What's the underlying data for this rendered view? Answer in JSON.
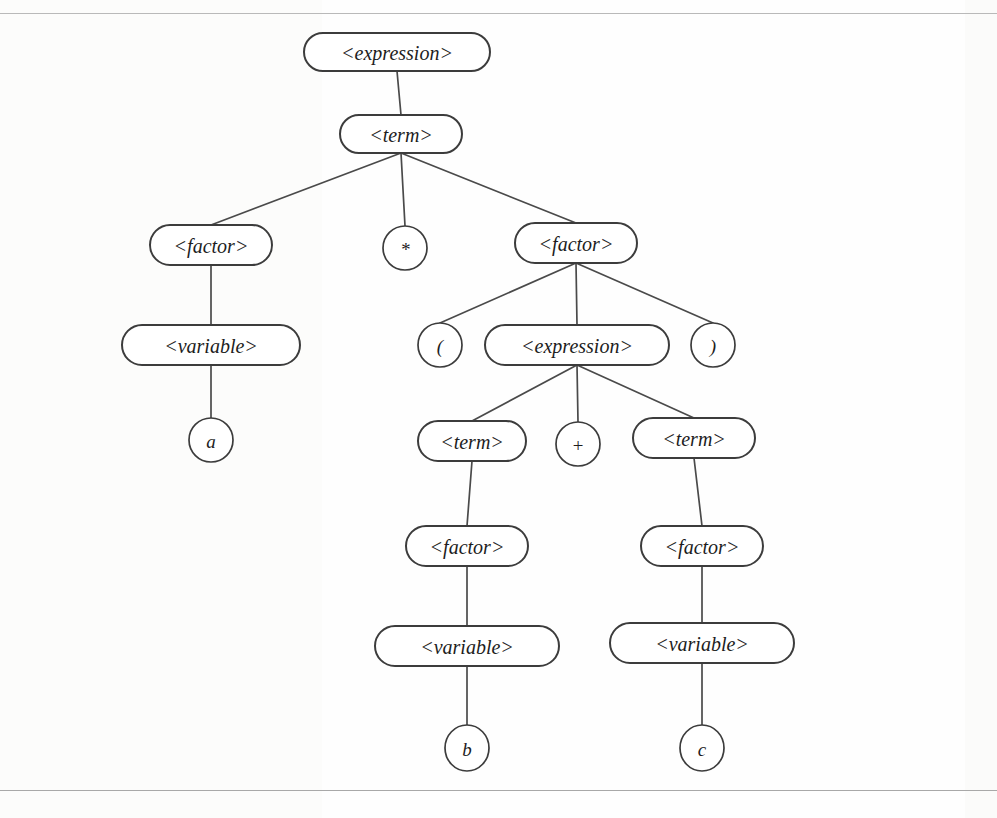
{
  "page": {
    "background_color": "#fefefe",
    "ink_color": "#3c3c3c",
    "rules": {
      "top_y": 13,
      "bottom_y": 790
    }
  },
  "diagram": {
    "type": "parse-tree",
    "grammar_symbols": {
      "nonterminals": [
        "<expression>",
        "<term>",
        "<factor>",
        "<variable>"
      ],
      "terminals": [
        "*",
        "(",
        ")",
        "+",
        "a",
        "b",
        "c"
      ]
    },
    "nodes": [
      {
        "id": "n1",
        "label": "<expression>",
        "kind": "nonterminal",
        "cx": 397,
        "cy": 52,
        "rw": 93,
        "rh": 19
      },
      {
        "id": "n2",
        "label": "<term>",
        "kind": "nonterminal",
        "cx": 401,
        "cy": 134,
        "rw": 61,
        "rh": 19
      },
      {
        "id": "n3",
        "label": "<factor>",
        "kind": "nonterminal",
        "cx": 211,
        "cy": 245,
        "rw": 61,
        "rh": 20
      },
      {
        "id": "n4",
        "label": "*",
        "kind": "terminal",
        "cx": 405,
        "cy": 248,
        "rw": 22,
        "rh": 22
      },
      {
        "id": "n5",
        "label": "<factor>",
        "kind": "nonterminal",
        "cx": 576,
        "cy": 243,
        "rw": 61,
        "rh": 20
      },
      {
        "id": "n6",
        "label": "<variable>",
        "kind": "nonterminal",
        "cx": 211,
        "cy": 345,
        "rw": 89,
        "rh": 20
      },
      {
        "id": "n7",
        "label": "a",
        "kind": "terminal",
        "cx": 211,
        "cy": 440,
        "rw": 22,
        "rh": 22
      },
      {
        "id": "n8",
        "label": "(",
        "kind": "terminal",
        "cx": 440,
        "cy": 345,
        "rw": 22,
        "rh": 22
      },
      {
        "id": "n9",
        "label": "<expression>",
        "kind": "nonterminal",
        "cx": 577,
        "cy": 345,
        "rw": 92,
        "rh": 20
      },
      {
        "id": "n10",
        "label": ")",
        "kind": "terminal",
        "cx": 713,
        "cy": 345,
        "rw": 22,
        "rh": 22
      },
      {
        "id": "n11",
        "label": "<term>",
        "kind": "nonterminal",
        "cx": 472,
        "cy": 441,
        "rw": 54,
        "rh": 20
      },
      {
        "id": "n12",
        "label": "+",
        "kind": "terminal",
        "cx": 578,
        "cy": 444,
        "rw": 22,
        "rh": 22
      },
      {
        "id": "n13",
        "label": "<term>",
        "kind": "nonterminal",
        "cx": 694,
        "cy": 438,
        "rw": 61,
        "rh": 20
      },
      {
        "id": "n14",
        "label": "<factor>",
        "kind": "nonterminal",
        "cx": 467,
        "cy": 546,
        "rw": 61,
        "rh": 20
      },
      {
        "id": "n15",
        "label": "<factor>",
        "kind": "nonterminal",
        "cx": 702,
        "cy": 546,
        "rw": 61,
        "rh": 20
      },
      {
        "id": "n16",
        "label": "<variable>",
        "kind": "nonterminal",
        "cx": 467,
        "cy": 646,
        "rw": 92,
        "rh": 20
      },
      {
        "id": "n17",
        "label": "<variable>",
        "kind": "nonterminal",
        "cx": 702,
        "cy": 643,
        "rw": 92,
        "rh": 20
      },
      {
        "id": "n18",
        "label": "b",
        "kind": "terminal",
        "cx": 467,
        "cy": 748,
        "rw": 22,
        "rh": 23
      },
      {
        "id": "n19",
        "label": "c",
        "kind": "terminal",
        "cx": 702,
        "cy": 748,
        "rw": 22,
        "rh": 23
      }
    ],
    "edges": [
      {
        "from": "n1",
        "to": "n2"
      },
      {
        "from": "n2",
        "to": "n3"
      },
      {
        "from": "n2",
        "to": "n4"
      },
      {
        "from": "n2",
        "to": "n5"
      },
      {
        "from": "n3",
        "to": "n6"
      },
      {
        "from": "n6",
        "to": "n7"
      },
      {
        "from": "n5",
        "to": "n8"
      },
      {
        "from": "n5",
        "to": "n9"
      },
      {
        "from": "n5",
        "to": "n10"
      },
      {
        "from": "n9",
        "to": "n11"
      },
      {
        "from": "n9",
        "to": "n12"
      },
      {
        "from": "n9",
        "to": "n13"
      },
      {
        "from": "n11",
        "to": "n14"
      },
      {
        "from": "n14",
        "to": "n16"
      },
      {
        "from": "n16",
        "to": "n18"
      },
      {
        "from": "n13",
        "to": "n15"
      },
      {
        "from": "n15",
        "to": "n17"
      },
      {
        "from": "n17",
        "to": "n19"
      }
    ]
  }
}
